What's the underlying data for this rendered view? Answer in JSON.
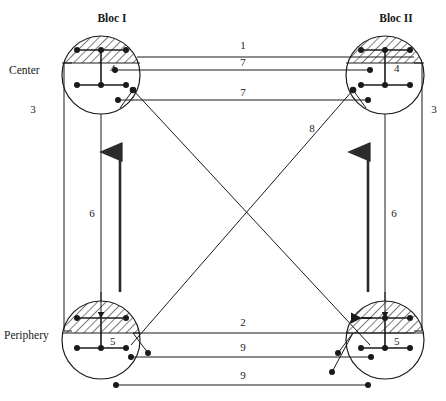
{
  "figure": {
    "title_fragment": "",
    "bloc_labels": [
      {
        "key": "bloc1",
        "text": "Bloc I",
        "x": 112,
        "y": 22
      },
      {
        "key": "bloc2",
        "text": "Bloc II",
        "x": 396,
        "y": 22
      }
    ],
    "row_labels": [
      {
        "key": "center",
        "text": "Center",
        "x": 30,
        "y": 74
      },
      {
        "key": "periphery",
        "text": "Periphery",
        "x": 35,
        "y": 339
      }
    ],
    "nodes": [
      {
        "key": "center-bloc1",
        "label": "4",
        "cx": 101,
        "cy": 75,
        "r": 39
      },
      {
        "key": "center-bloc2",
        "label": "4",
        "cx": 385,
        "cy": 75,
        "r": 39
      },
      {
        "key": "periphery-bloc1",
        "label": "5",
        "cx": 101,
        "cy": 340,
        "r": 39
      },
      {
        "key": "periphery-bloc2",
        "label": "5",
        "cx": 385,
        "cy": 340,
        "r": 39
      }
    ],
    "edge_labels": [
      {
        "key": "edge-1",
        "text": "1",
        "x": 243,
        "y": 49
      },
      {
        "key": "edge-7-top",
        "text": "7",
        "x": 243,
        "y": 65
      },
      {
        "key": "edge-7-second",
        "text": "7",
        "x": 243,
        "y": 96
      },
      {
        "key": "edge-8",
        "text": "8",
        "x": 312,
        "y": 132
      },
      {
        "key": "edge-3-left",
        "text": "3",
        "x": 33,
        "y": 113
      },
      {
        "key": "edge-3-right",
        "text": "3",
        "x": 434,
        "y": 113
      },
      {
        "key": "edge-6-left",
        "text": "6",
        "x": 92,
        "y": 217
      },
      {
        "key": "edge-6-right",
        "text": "6",
        "x": 394,
        "y": 217
      },
      {
        "key": "edge-2",
        "text": "2",
        "x": 243,
        "y": 326
      },
      {
        "key": "edge-9-top",
        "text": "9",
        "x": 243,
        "y": 350
      },
      {
        "key": "edge-9-bottom",
        "text": "9",
        "x": 243,
        "y": 378
      }
    ]
  }
}
